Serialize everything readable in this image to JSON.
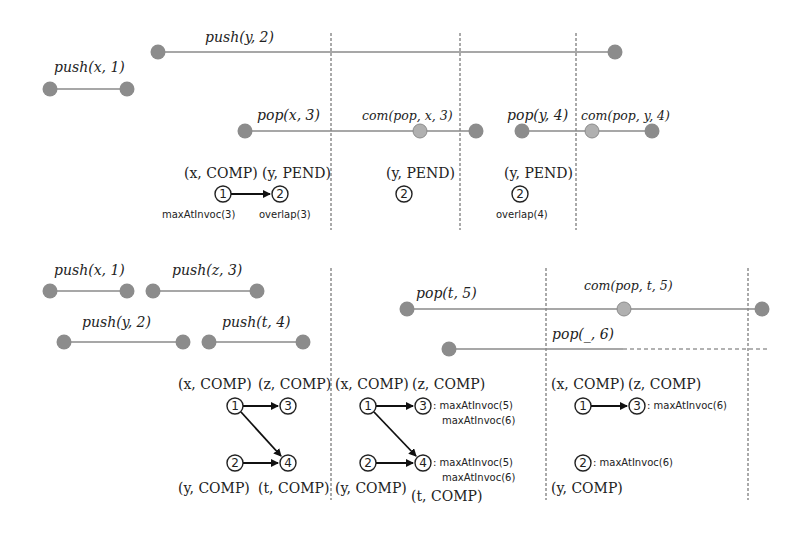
{
  "diagram": {
    "top": {
      "operations": [
        {
          "label": "push(y, 2)"
        },
        {
          "label": "push(x, 1)"
        },
        {
          "label": "pop(x, 3)"
        },
        {
          "label": "com(pop, x, 3)"
        },
        {
          "label": "pop(y, 4)"
        },
        {
          "label": "com(pop, y, 4)"
        }
      ],
      "snapshots": [
        {
          "nodes": [
            {
              "id": "1",
              "state": "(x, COMP)",
              "annotation": "maxAtInvoc(3)"
            },
            {
              "id": "2",
              "state": "(y, PEND)",
              "annotation": "overlap(3)"
            }
          ],
          "edges": [
            [
              "1",
              "2"
            ]
          ]
        },
        {
          "nodes": [
            {
              "id": "2",
              "state": "(y, PEND)"
            }
          ]
        },
        {
          "nodes": [
            {
              "id": "2",
              "state": "(y, PEND)",
              "annotation": "overlap(4)"
            }
          ]
        }
      ]
    },
    "bottom": {
      "operations": [
        {
          "label": "push(x, 1)"
        },
        {
          "label": "push(z, 3)"
        },
        {
          "label": "push(y, 2)"
        },
        {
          "label": "push(t, 4)"
        },
        {
          "label": "pop(t, 5)"
        },
        {
          "label": "com(pop, t, 5)"
        },
        {
          "label": "pop(_, 6)"
        }
      ],
      "snapshots": [
        {
          "nodes": [
            {
              "id": "1",
              "state": "(x, COMP)"
            },
            {
              "id": "3",
              "state": "(z, COMP)"
            },
            {
              "id": "2",
              "state": "(y, COMP)"
            },
            {
              "id": "4",
              "state": "(t, COMP)"
            }
          ],
          "edges": [
            [
              "1",
              "3"
            ],
            [
              "1",
              "4"
            ],
            [
              "2",
              "4"
            ]
          ]
        },
        {
          "nodes": [
            {
              "id": "1",
              "state": "(x, COMP)"
            },
            {
              "id": "3",
              "state": "(z, COMP)",
              "annotations": [
                ": maxAtInvoc(5)",
                "maxAtInvoc(6)"
              ]
            },
            {
              "id": "2",
              "state": "(y, COMP)"
            },
            {
              "id": "4",
              "state": "(t, COMP)",
              "annotations": [
                ": maxAtInvoc(5)",
                "maxAtInvoc(6)"
              ]
            }
          ],
          "edges": [
            [
              "1",
              "3"
            ],
            [
              "1",
              "4"
            ],
            [
              "2",
              "4"
            ]
          ]
        },
        {
          "nodes": [
            {
              "id": "1",
              "state": "(x, COMP)"
            },
            {
              "id": "3",
              "state": "(z, COMP)",
              "annotations": [
                ": maxAtInvoc(6)"
              ]
            },
            {
              "id": "2",
              "state": "(y, COMP)",
              "annotations": [
                ": maxAtInvoc(6)"
              ]
            }
          ],
          "edges": [
            [
              "1",
              "3"
            ]
          ]
        }
      ]
    }
  }
}
